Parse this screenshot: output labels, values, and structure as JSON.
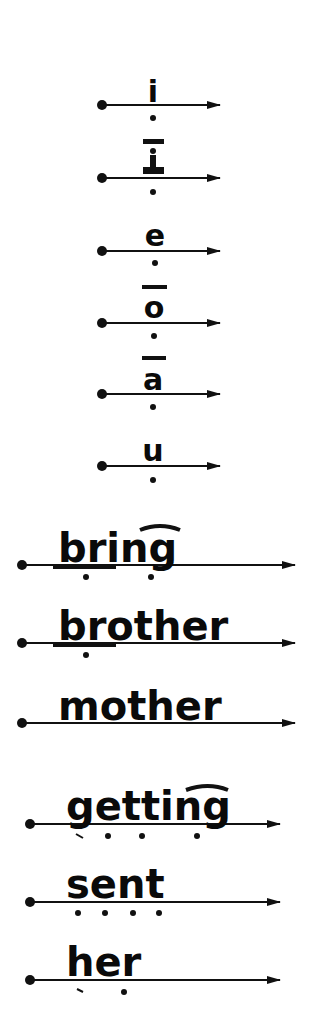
{
  "page": {
    "background": "#ffffff",
    "ink_color": "#111111"
  },
  "rows": [
    {
      "id": "i",
      "text": "i",
      "mark": "none",
      "marks_below": [
        "dot"
      ],
      "line_y": 105,
      "x_start": 102,
      "x_end": 220
    },
    {
      "id": "i-long",
      "text": "I",
      "mark": "serif-I",
      "marks_below": [
        "dot"
      ],
      "line_y": 178,
      "x_start": 102,
      "x_end": 220
    },
    {
      "id": "e",
      "text": "e",
      "mark": "none",
      "marks_below": [
        "dot"
      ],
      "line_y": 251,
      "x_start": 102,
      "x_end": 220
    },
    {
      "id": "o-macron",
      "text": "o",
      "mark": "macron",
      "marks_below": [
        "dot"
      ],
      "line_y": 323,
      "x_start": 102,
      "x_end": 220
    },
    {
      "id": "a-macron",
      "text": "a",
      "mark": "macron",
      "marks_below": [
        "dot"
      ],
      "line_y": 394,
      "x_start": 102,
      "x_end": 220
    },
    {
      "id": "u",
      "text": "u",
      "mark": "none",
      "marks_below": [
        "dot"
      ],
      "line_y": 466,
      "x_start": 102,
      "x_end": 220
    },
    {
      "id": "bring",
      "text": "bring",
      "mark": "arc-over-ng",
      "underline": "br",
      "marks_below": [
        "dot-under-br",
        "dot-under-ng"
      ],
      "line_y": 565,
      "x_start": 22,
      "x_end": 295
    },
    {
      "id": "brother",
      "text": "brother",
      "mark": "none",
      "underline": "br",
      "marks_below": [
        "dot-under-br"
      ],
      "line_y": 643,
      "x_start": 22,
      "x_end": 295
    },
    {
      "id": "mother",
      "text": "mother",
      "mark": "none",
      "marks_below": [],
      "line_y": 723,
      "x_start": 22,
      "x_end": 295
    },
    {
      "id": "getting",
      "text": "getting",
      "mark": "arc-over-ng",
      "marks_below": [
        "hook",
        "dot",
        "dot",
        "dot"
      ],
      "line_y": 824,
      "x_start": 30,
      "x_end": 280
    },
    {
      "id": "sent",
      "text": "sent",
      "mark": "none",
      "marks_below": [
        "dot",
        "dot",
        "dot",
        "dot"
      ],
      "line_y": 902,
      "x_start": 30,
      "x_end": 280
    },
    {
      "id": "her",
      "text": "her",
      "mark": "none",
      "marks_below": [
        "hook",
        "dot"
      ],
      "line_y": 980,
      "x_start": 30,
      "x_end": 280
    }
  ]
}
